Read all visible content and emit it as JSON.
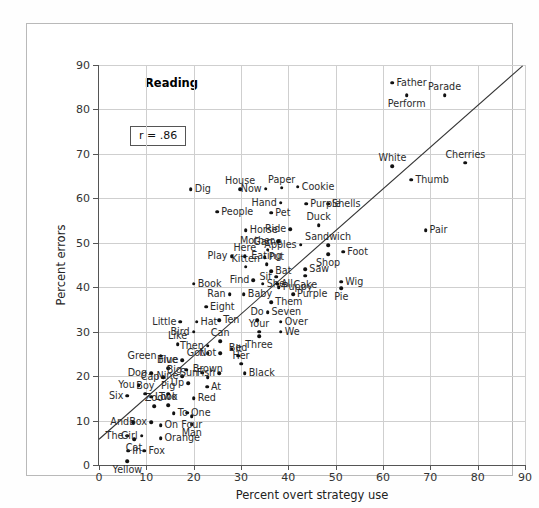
{
  "chart_data": {
    "type": "scatter",
    "title": "Reading",
    "xlabel": "Percent overt strategy use",
    "ylabel": "Percent errors",
    "xlim": [
      0,
      90
    ],
    "ylim": [
      0,
      90
    ],
    "xticks": [
      0,
      10,
      20,
      30,
      40,
      50,
      60,
      70,
      80,
      90
    ],
    "yticks": [
      0,
      10,
      20,
      30,
      40,
      50,
      60,
      70,
      80,
      90
    ],
    "grid": true,
    "legend": "none",
    "annotation": "r = .86",
    "correlation": 0.86,
    "fit_line": {
      "x0": 0,
      "y0": 5.8,
      "x1": 89.5,
      "y1": 89.8
    },
    "points": [
      {
        "label": "Yellow",
        "x": 6.0,
        "y": 0.8,
        "pos": "b"
      },
      {
        "label": "In",
        "x": 6.2,
        "y": 3.2,
        "pos": "r"
      },
      {
        "label": "Fox",
        "x": 9.6,
        "y": 3.2,
        "pos": "r"
      },
      {
        "label": "Cat",
        "x": 7.4,
        "y": 5.8,
        "pos": "b"
      },
      {
        "label": "The",
        "x": 6.0,
        "y": 6.6,
        "pos": "l"
      },
      {
        "label": "Girl",
        "x": 9.0,
        "y": 6.6,
        "pos": "l"
      },
      {
        "label": "Orange",
        "x": 13.0,
        "y": 6.0,
        "pos": "r"
      },
      {
        "label": "And",
        "x": 7.2,
        "y": 9.6,
        "pos": "l"
      },
      {
        "label": "Box",
        "x": 11.0,
        "y": 9.6,
        "pos": "l"
      },
      {
        "label": "On",
        "x": 13.0,
        "y": 9.0,
        "pos": "r"
      },
      {
        "label": "Man",
        "x": 19.6,
        "y": 9.2,
        "pos": "b"
      },
      {
        "label": "Four",
        "x": 19.6,
        "y": 11.0,
        "pos": "b"
      },
      {
        "label": "To",
        "x": 15.8,
        "y": 11.6,
        "pos": "r"
      },
      {
        "label": "One",
        "x": 18.6,
        "y": 11.8,
        "pos": "r"
      },
      {
        "label": "Zoo",
        "x": 11.6,
        "y": 13.2,
        "pos": "t"
      },
      {
        "label": "Two",
        "x": 14.6,
        "y": 13.4,
        "pos": "t"
      },
      {
        "label": "Look",
        "x": 11.0,
        "y": 15.4,
        "pos": "r"
      },
      {
        "label": "Six",
        "x": 6.0,
        "y": 15.6,
        "pos": "l"
      },
      {
        "label": "Boy",
        "x": 9.8,
        "y": 16.0,
        "pos": "t"
      },
      {
        "label": "Pig",
        "x": 14.6,
        "y": 16.0,
        "pos": "t"
      },
      {
        "label": "Red",
        "x": 20.0,
        "y": 15.0,
        "pos": "r"
      },
      {
        "label": "You",
        "x": 8.4,
        "y": 18.0,
        "pos": "l"
      },
      {
        "label": "At",
        "x": 22.8,
        "y": 17.6,
        "pos": "r"
      },
      {
        "label": "Up",
        "x": 18.8,
        "y": 18.4,
        "pos": "l"
      },
      {
        "label": "Brown",
        "x": 23.0,
        "y": 19.8,
        "pos": "t"
      },
      {
        "label": "Nine",
        "x": 17.6,
        "y": 20.0,
        "pos": "l"
      },
      {
        "label": "Dog",
        "x": 11.0,
        "y": 20.6,
        "pos": "l"
      },
      {
        "label": "Cap",
        "x": 13.6,
        "y": 19.8,
        "pos": "l"
      },
      {
        "label": "Sun",
        "x": 21.8,
        "y": 20.8,
        "pos": "l"
      },
      {
        "label": "Five",
        "x": 14.6,
        "y": 21.8,
        "pos": "t"
      },
      {
        "label": "Big",
        "x": 18.4,
        "y": 21.4,
        "pos": "l"
      },
      {
        "label": "Fish",
        "x": 25.4,
        "y": 20.6,
        "pos": "l"
      },
      {
        "label": "Black",
        "x": 30.8,
        "y": 20.6,
        "pos": "r"
      },
      {
        "label": "Her",
        "x": 30.0,
        "y": 22.8,
        "pos": "t"
      },
      {
        "label": "Blue",
        "x": 17.6,
        "y": 23.6,
        "pos": "l"
      },
      {
        "label": "Bed",
        "x": 29.4,
        "y": 24.6,
        "pos": "t"
      },
      {
        "label": "Green",
        "x": 13.0,
        "y": 24.6,
        "pos": "l"
      },
      {
        "label": "Got",
        "x": 23.0,
        "y": 25.2,
        "pos": "l"
      },
      {
        "label": "Not",
        "x": 25.6,
        "y": 25.2,
        "pos": "l"
      },
      {
        "label": "It",
        "x": 28.0,
        "y": 26.2,
        "pos": "r"
      },
      {
        "label": "Like",
        "x": 16.6,
        "y": 27.2,
        "pos": "t"
      },
      {
        "label": "Then",
        "x": 23.0,
        "y": 26.8,
        "pos": "l"
      },
      {
        "label": "Can",
        "x": 25.6,
        "y": 27.8,
        "pos": "t"
      },
      {
        "label": "Bird",
        "x": 20.0,
        "y": 30.0,
        "pos": "l"
      },
      {
        "label": "Three",
        "x": 33.8,
        "y": 29.0,
        "pos": "b"
      },
      {
        "label": "Your",
        "x": 33.8,
        "y": 30.0,
        "pos": "t"
      },
      {
        "label": "We",
        "x": 38.4,
        "y": 30.0,
        "pos": "r"
      },
      {
        "label": "Over",
        "x": 38.4,
        "y": 32.2,
        "pos": "r"
      },
      {
        "label": "Little",
        "x": 17.2,
        "y": 32.2,
        "pos": "l"
      },
      {
        "label": "Hat",
        "x": 20.6,
        "y": 32.2,
        "pos": "r"
      },
      {
        "label": "Ten",
        "x": 25.4,
        "y": 32.6,
        "pos": "r"
      },
      {
        "label": "Do",
        "x": 33.4,
        "y": 32.6,
        "pos": "t"
      },
      {
        "label": "Seven",
        "x": 35.6,
        "y": 34.4,
        "pos": "r"
      },
      {
        "label": "Eight",
        "x": 22.6,
        "y": 35.6,
        "pos": "r"
      },
      {
        "label": "Them",
        "x": 36.4,
        "y": 36.6,
        "pos": "r"
      },
      {
        "label": "Ran",
        "x": 27.6,
        "y": 38.4,
        "pos": "l"
      },
      {
        "label": "Baby",
        "x": 30.6,
        "y": 38.4,
        "pos": "r"
      },
      {
        "label": "Purple2",
        "x": 41.0,
        "y": 38.4,
        "pos": "r"
      },
      {
        "label": "Puppy",
        "x": 38.0,
        "y": 40.0,
        "pos": "r"
      },
      {
        "label": "Book",
        "x": 20.0,
        "y": 40.8,
        "pos": "r"
      },
      {
        "label": "She",
        "x": 34.6,
        "y": 40.8,
        "pos": "r"
      },
      {
        "label": "All",
        "x": 37.6,
        "y": 40.8,
        "pos": "r"
      },
      {
        "label": "Find",
        "x": 32.6,
        "y": 41.6,
        "pos": "l"
      },
      {
        "label": "Pie",
        "x": 51.2,
        "y": 39.8,
        "pos": "b"
      },
      {
        "label": "Wig",
        "x": 51.2,
        "y": 41.2,
        "pos": "r"
      },
      {
        "label": "Sit",
        "x": 37.4,
        "y": 42.4,
        "pos": "l"
      },
      {
        "label": "Cake",
        "x": 43.6,
        "y": 42.6,
        "pos": "b"
      },
      {
        "label": "Bat",
        "x": 36.4,
        "y": 43.6,
        "pos": "r"
      },
      {
        "label": "Saw",
        "x": 43.6,
        "y": 44.0,
        "pos": "r"
      },
      {
        "label": "Kitten",
        "x": 31.0,
        "y": 44.6,
        "pos": "t"
      },
      {
        "label": "Eating",
        "x": 35.4,
        "y": 45.2,
        "pos": "t"
      },
      {
        "label": "Here",
        "x": 30.8,
        "y": 47.0,
        "pos": "t"
      },
      {
        "label": "Put",
        "x": 35.0,
        "y": 46.8,
        "pos": "r"
      },
      {
        "label": "Play",
        "x": 28.0,
        "y": 47.0,
        "pos": "l"
      },
      {
        "label": "Game",
        "x": 35.6,
        "y": 48.4,
        "pos": "t"
      },
      {
        "label": "Shop",
        "x": 48.4,
        "y": 47.4,
        "pos": "b"
      },
      {
        "label": "Foot",
        "x": 51.6,
        "y": 48.0,
        "pos": "r"
      },
      {
        "label": "Sandwich",
        "x": 48.4,
        "y": 49.4,
        "pos": "t"
      },
      {
        "label": "Apples",
        "x": 42.6,
        "y": 49.6,
        "pos": "l"
      },
      {
        "label": "Mother",
        "x": 37.8,
        "y": 50.4,
        "pos": "l"
      },
      {
        "label": "Pair",
        "x": 69.0,
        "y": 52.8,
        "pos": "r"
      },
      {
        "label": "Horse",
        "x": 31.0,
        "y": 52.8,
        "pos": "r"
      },
      {
        "label": "Ride",
        "x": 40.4,
        "y": 53.0,
        "pos": "l"
      },
      {
        "label": "Duck",
        "x": 46.4,
        "y": 54.0,
        "pos": "t"
      },
      {
        "label": "Pet",
        "x": 36.4,
        "y": 56.8,
        "pos": "r"
      },
      {
        "label": "People",
        "x": 25.0,
        "y": 57.0,
        "pos": "r"
      },
      {
        "label": "Shells",
        "x": 48.4,
        "y": 58.8,
        "pos": "r"
      },
      {
        "label": "Purple",
        "x": 43.8,
        "y": 58.8,
        "pos": "r"
      },
      {
        "label": "Hand",
        "x": 38.4,
        "y": 59.0,
        "pos": "l"
      },
      {
        "label": "Dig",
        "x": 19.4,
        "y": 62.0,
        "pos": "r"
      },
      {
        "label": "House",
        "x": 29.8,
        "y": 62.0,
        "pos": "t"
      },
      {
        "label": "Now",
        "x": 35.2,
        "y": 62.2,
        "pos": "l"
      },
      {
        "label": "Paper",
        "x": 38.6,
        "y": 62.4,
        "pos": "t"
      },
      {
        "label": "Cookie",
        "x": 42.0,
        "y": 62.6,
        "pos": "r"
      },
      {
        "label": "White",
        "x": 62.0,
        "y": 67.2,
        "pos": "t"
      },
      {
        "label": "Thumb",
        "x": 66.0,
        "y": 64.2,
        "pos": "r"
      },
      {
        "label": "Cherries",
        "x": 77.4,
        "y": 68.0,
        "pos": "t"
      },
      {
        "label": "Perform",
        "x": 65.0,
        "y": 83.2,
        "pos": "b"
      },
      {
        "label": "Parade",
        "x": 73.0,
        "y": 83.2,
        "pos": "t"
      },
      {
        "label": "Father",
        "x": 62.0,
        "y": 86.0,
        "pos": "r"
      }
    ]
  },
  "axes": {
    "y_title": "Percent errors",
    "x_title": "Percent overt strategy use"
  }
}
